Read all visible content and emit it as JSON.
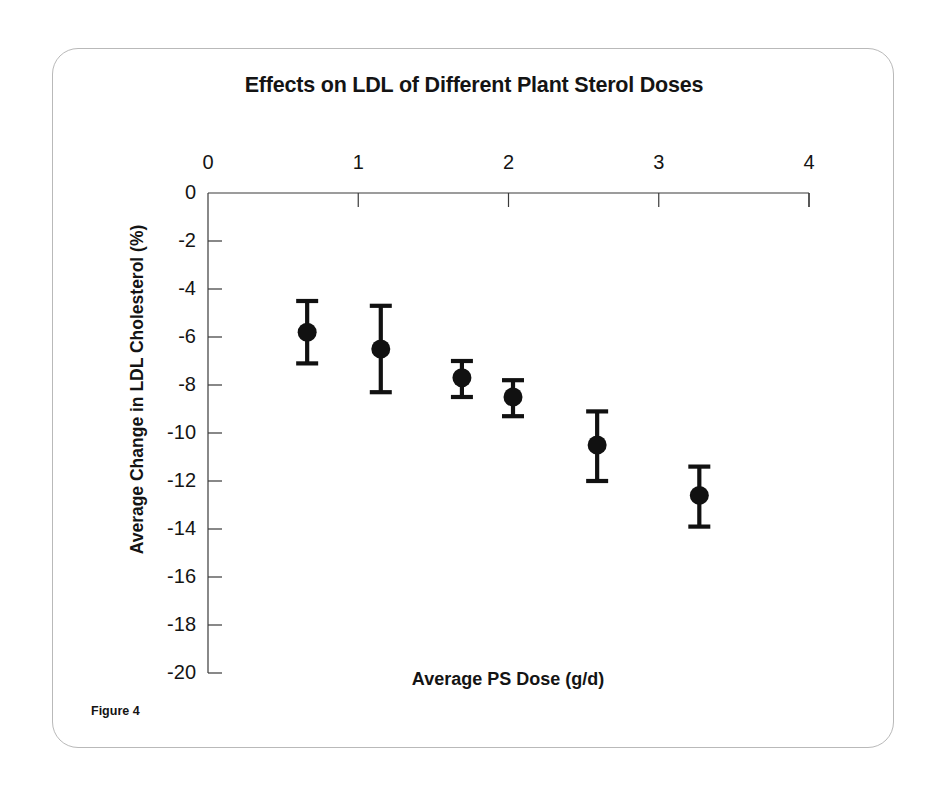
{
  "figure": {
    "caption": "Figure 4",
    "title": "Effects on LDL of Different Plant Sterol Doses"
  },
  "chart_data": {
    "type": "scatter",
    "title": "Effects on LDL of Different Plant Sterol Doses",
    "xlabel": "Average PS Dose (g/d)",
    "ylabel": "Average Change in LDL Cholesterol (%)",
    "xlim": [
      0,
      4
    ],
    "ylim": [
      -20,
      0
    ],
    "xticks": [
      0,
      1,
      2,
      3,
      4
    ],
    "xtick_labels": [
      "0",
      "1",
      "2",
      "3",
      "4"
    ],
    "yticks": [
      0,
      -2,
      -4,
      -6,
      -8,
      -10,
      -12,
      -14,
      -16,
      -18,
      -20
    ],
    "ytick_labels": [
      "0",
      "-2",
      "-4",
      "-6",
      "-8",
      "-10",
      "-12",
      "-14",
      "-16",
      "-18",
      "-20"
    ],
    "x_axis_position": "top",
    "grid": false,
    "legend": null,
    "error_bars": "vertical",
    "marker": "filled-circle",
    "marker_color": "#111111",
    "points": [
      {
        "x": 0.66,
        "y": -5.8,
        "y_low": -7.1,
        "y_high": -4.5
      },
      {
        "x": 1.15,
        "y": -6.5,
        "y_low": -8.3,
        "y_high": -4.7
      },
      {
        "x": 1.69,
        "y": -7.7,
        "y_low": -8.5,
        "y_high": -7.0
      },
      {
        "x": 2.03,
        "y": -8.5,
        "y_low": -9.3,
        "y_high": -7.8
      },
      {
        "x": 2.59,
        "y": -10.5,
        "y_low": -12.0,
        "y_high": -9.1
      },
      {
        "x": 3.27,
        "y": -12.6,
        "y_low": -13.9,
        "y_high": -11.4
      }
    ]
  }
}
